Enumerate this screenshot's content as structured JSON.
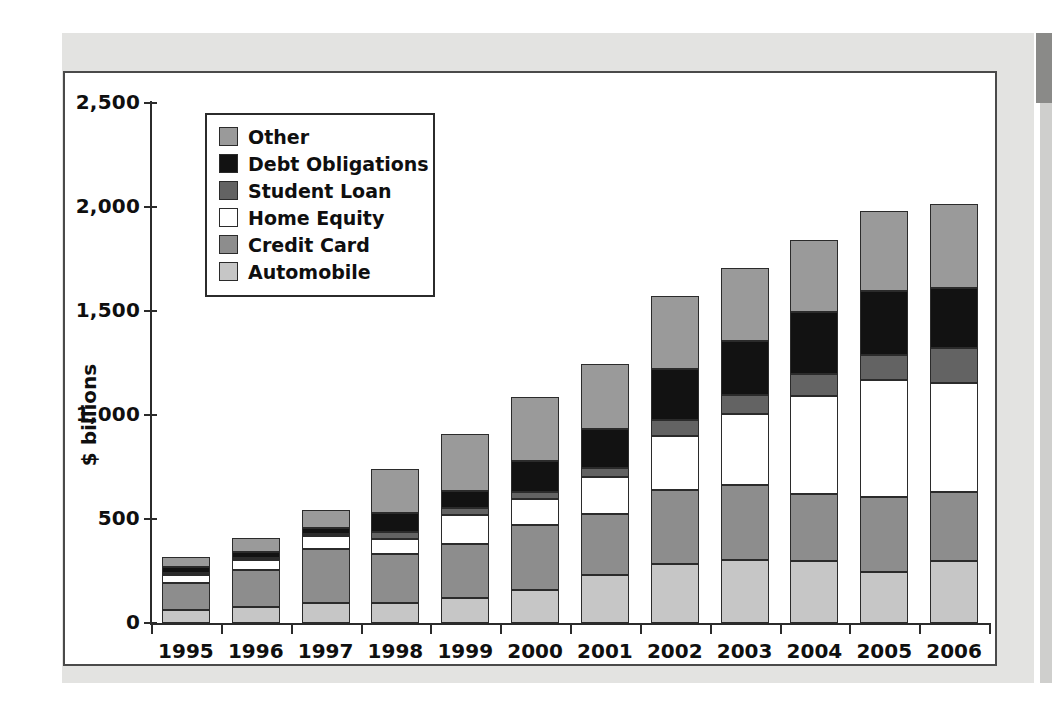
{
  "chart_data": {
    "type": "bar",
    "stacked": true,
    "title": "",
    "xlabel": "",
    "ylabel": "$ billions",
    "ylim": [
      0,
      2500
    ],
    "ytick_labels": [
      "0",
      "500",
      "1,000",
      "1,500",
      "2,000",
      "2,500"
    ],
    "ytick_values": [
      0,
      500,
      1000,
      1500,
      2000,
      2500
    ],
    "grid": false,
    "legend_position": "upper-left-inside",
    "categories": [
      "1995",
      "1996",
      "1997",
      "1998",
      "1999",
      "2000",
      "2001",
      "2002",
      "2003",
      "2004",
      "2005",
      "2006"
    ],
    "series": [
      {
        "name": "Automobile",
        "color": "#c6c6c6",
        "values": [
          62,
          77,
          96,
          96,
          120,
          159,
          231,
          284,
          303,
          298,
          245,
          298
        ]
      },
      {
        "name": "Credit Card",
        "color": "#8d8d8d",
        "values": [
          130,
          178,
          260,
          236,
          260,
          313,
          293,
          356,
          361,
          322,
          361,
          332
        ]
      },
      {
        "name": "Home Equity",
        "color": "#ffffff",
        "values": [
          38,
          48,
          63,
          72,
          139,
          125,
          178,
          260,
          341,
          471,
          563,
          524
        ]
      },
      {
        "name": "Student Loan",
        "color": "#636363",
        "values": [
          10,
          10,
          10,
          34,
          34,
          34,
          43,
          77,
          91,
          106,
          120,
          168
        ]
      },
      {
        "name": "Debt Obligations",
        "color": "#121212",
        "values": [
          29,
          29,
          29,
          91,
          82,
          149,
          188,
          245,
          260,
          298,
          308,
          288
        ]
      },
      {
        "name": "Other",
        "color": "#9a9a9a",
        "values": [
          48,
          67,
          87,
          212,
          274,
          308,
          313,
          351,
          351,
          346,
          385,
          404
        ]
      }
    ],
    "totals": [
      317,
      409,
      545,
      741,
      909,
      1088,
      1246,
      1573,
      1707,
      1841,
      1982,
      2014
    ]
  },
  "legend": {
    "items": [
      {
        "label": "Other",
        "color": "#9a9a9a"
      },
      {
        "label": "Debt Obligations",
        "color": "#121212"
      },
      {
        "label": "Student Loan",
        "color": "#636363"
      },
      {
        "label": "Home Equity",
        "color": "#ffffff"
      },
      {
        "label": "Credit Card",
        "color": "#8d8d8d"
      },
      {
        "label": "Automobile",
        "color": "#c6c6c6"
      }
    ]
  },
  "axes": {
    "y_title": "$ billions"
  }
}
